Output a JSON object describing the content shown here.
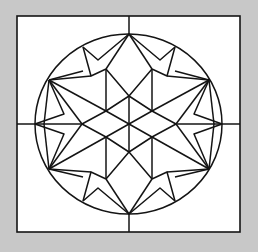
{
  "figure": {
    "background": "#c8c8c8",
    "panel_fill": "#ffffff",
    "stroke": "#141414"
  }
}
